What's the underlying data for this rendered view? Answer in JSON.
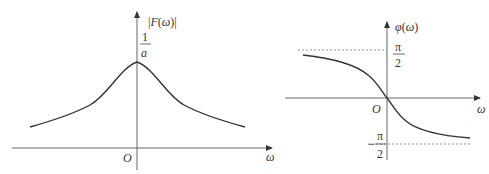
{
  "figure": {
    "caption_fragment": "",
    "left_plot": {
      "title": "Amplitude spectrum",
      "y_label": "|F(ω)|",
      "x_label": "ω",
      "origin_label": "O",
      "peak_label": {
        "numerator": "1",
        "denominator": "a"
      }
    },
    "right_plot": {
      "title": "Phase spectrum",
      "y_label": "φ(ω)",
      "x_label": "ω",
      "origin_label": "O",
      "upper_asymptote": {
        "numerator": "π",
        "denominator": "2"
      },
      "lower_asymptote": {
        "sign": "−",
        "numerator": "π",
        "denominator": "2"
      }
    },
    "colors": {
      "axis": "#555555",
      "curve": "#333333",
      "dotted": "#777777",
      "text": "#333333"
    }
  }
}
